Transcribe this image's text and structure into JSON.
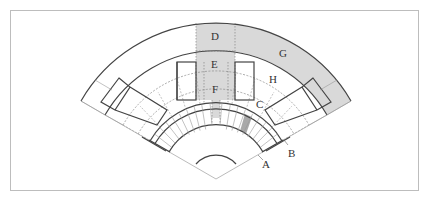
{
  "diagram": {
    "type": "fan-shaped seating plan (stadium/theater sectors)",
    "labels": {
      "A": "A",
      "B": "B",
      "C": "C",
      "D": "D",
      "E": "E",
      "F": "F",
      "G": "G",
      "H": "H"
    },
    "colors": {
      "shaded_region": "#d9d9d9",
      "shaded_dark": "#a9a9a9",
      "line_solid": "#444444",
      "line_light": "#aaaaaa",
      "frame": "#bdbdbd",
      "background": "#ffffff"
    }
  }
}
